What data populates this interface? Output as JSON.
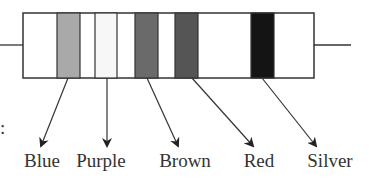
{
  "figure": {
    "type": "resistor-color-code-diagram",
    "leading_text_fragment": ":",
    "body": {
      "x": 23,
      "y": 13,
      "width": 291,
      "height": 65,
      "fill": "#ffffff",
      "stroke": "#333333"
    },
    "leads": {
      "left": {
        "x1": 0,
        "y1": 45,
        "x2": 23,
        "y2": 45
      },
      "right": {
        "x1": 314,
        "y1": 45,
        "x2": 351,
        "y2": 45
      }
    },
    "bands": [
      {
        "name": "Blue",
        "x": 57,
        "width": 23,
        "fill": "#a9a9a9",
        "arrow_from": [
          68,
          78
        ],
        "arrow_to": [
          41,
          146
        ],
        "label_x": 42
      },
      {
        "name": "Purple",
        "x": 95,
        "width": 22,
        "fill": "#f7f7f7",
        "arrow_from": [
          107,
          78
        ],
        "arrow_to": [
          107,
          146
        ],
        "label_x": 101
      },
      {
        "name": "Brown",
        "x": 135,
        "width": 23,
        "fill": "#6a6a6a",
        "arrow_from": [
          147,
          78
        ],
        "arrow_to": [
          178,
          146
        ],
        "label_x": 185
      },
      {
        "name": "Red",
        "x": 175,
        "width": 23,
        "fill": "#555555",
        "arrow_from": [
          192,
          78
        ],
        "arrow_to": [
          253,
          146
        ],
        "label_x": 259
      },
      {
        "name": "Silver",
        "x": 251,
        "width": 23,
        "fill": "#141414",
        "arrow_from": [
          262,
          78
        ],
        "arrow_to": [
          316,
          146
        ],
        "label_x": 330
      }
    ],
    "labels": [
      "Blue",
      "Purple",
      "Brown",
      "Red",
      "Silver"
    ]
  }
}
